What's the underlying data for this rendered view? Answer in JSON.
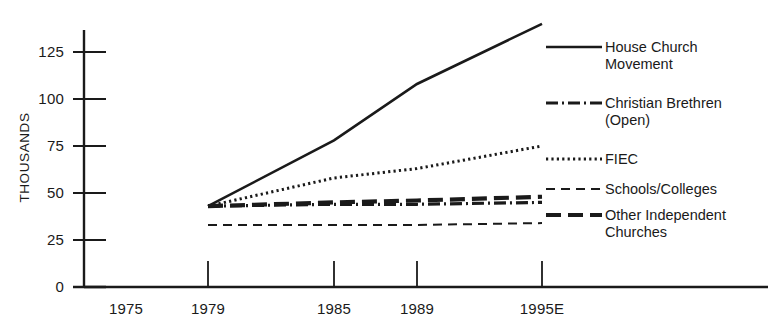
{
  "chart_data": {
    "type": "line",
    "title": "",
    "xlabel": "",
    "ylabel": "THOUSANDS",
    "x_tick_labels": [
      "1975",
      "1979",
      "1985",
      "1989",
      "1995E"
    ],
    "x_tick_values": [
      1975,
      1979,
      1985,
      1989,
      1995
    ],
    "y_tick_labels": [
      "0",
      "25",
      "50",
      "75",
      "100",
      "125"
    ],
    "y_tick_values": [
      0,
      25,
      50,
      75,
      100,
      125
    ],
    "xlim": [
      1975,
      1996
    ],
    "ylim": [
      0,
      140
    ],
    "grid": false,
    "legend_position": "right",
    "series": [
      {
        "name": "House Church Movement",
        "legend_label": "House Church\nMovement",
        "style": "solid",
        "x": [
          1979,
          1985,
          1989,
          1995
        ],
        "values": [
          43,
          78,
          108,
          140
        ]
      },
      {
        "name": "Christian Brethren (Open)",
        "legend_label": "Christian Brethren\n(Open)",
        "style": "dash-dot",
        "x": [
          1979,
          1985,
          1989,
          1995
        ],
        "values": [
          43,
          44,
          44,
          45
        ]
      },
      {
        "name": "FIEC",
        "legend_label": "FIEC",
        "style": "dotted",
        "x": [
          1979,
          1985,
          1989,
          1995
        ],
        "values": [
          43,
          58,
          63,
          75
        ]
      },
      {
        "name": "Schools/Colleges",
        "legend_label": "Schools/Colleges",
        "style": "dashed-thin",
        "x": [
          1979,
          1985,
          1989,
          1995
        ],
        "values": [
          33,
          33,
          33,
          34
        ]
      },
      {
        "name": "Other Independent Churches",
        "legend_label": "Other Independent\nChurches",
        "style": "dashed-thick",
        "x": [
          1979,
          1985,
          1989,
          1995
        ],
        "values": [
          43,
          45,
          46,
          48
        ]
      }
    ]
  },
  "axis": {
    "y_label": "THOUSANDS",
    "y_ticks": [
      "125",
      "100",
      "75",
      "50",
      "25",
      "0"
    ],
    "x_ticks": [
      "1975",
      "1979",
      "1985",
      "1989",
      "1995E"
    ]
  },
  "legend": {
    "items": [
      {
        "label": "House Church\nMovement",
        "style": "solid"
      },
      {
        "label": "Christian Brethren\n(Open)",
        "style": "dash-dot"
      },
      {
        "label": "FIEC",
        "style": "dotted"
      },
      {
        "label": "Schools/Colleges",
        "style": "dashed-thin"
      },
      {
        "label": "Other Independent\nChurches",
        "style": "dashed-thick"
      }
    ]
  },
  "colors": {
    "ink": "#1a1a1a",
    "background": "#ffffff"
  }
}
